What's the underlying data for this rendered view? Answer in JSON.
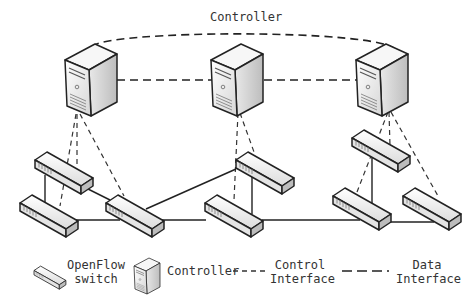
{
  "title": "Controller",
  "legend": {
    "switch_label_line1": "OpenFlow",
    "switch_label_line2": "switch",
    "controller_label": "Controller",
    "control_interface_line1": "Control",
    "control_interface_line2": "Interface",
    "data_interface_line1": "Data",
    "data_interface_line2": "Interface"
  },
  "nodes": {
    "controllers": [
      "controller-1",
      "controller-2",
      "controller-3"
    ],
    "switches": [
      "switch-1",
      "switch-2",
      "switch-3",
      "switch-4",
      "switch-5",
      "switch-6",
      "switch-7",
      "switch-8"
    ]
  },
  "colors": {
    "line": "#222222",
    "device_fill": "#f2f2f2",
    "device_shade": "#cfcfcf"
  }
}
